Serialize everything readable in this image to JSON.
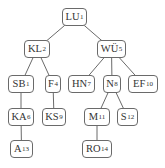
{
  "diagram": {
    "type": "tree",
    "colors": {
      "edge": "#6a6a6a",
      "border": "#6a6a6a",
      "text": "#333333",
      "background": "#ffffff"
    },
    "nodes": [
      {
        "id": "LU1",
        "label": "LU",
        "sub": "1",
        "x": 62,
        "y": 8,
        "w": 25
      },
      {
        "id": "KL2",
        "label": "KL",
        "sub": "2",
        "x": 24,
        "y": 40,
        "w": 26
      },
      {
        "id": "WU5",
        "label": "WÜ",
        "sub": "5",
        "x": 97,
        "y": 40,
        "w": 29
      },
      {
        "id": "SB1",
        "label": "SB",
        "sub": "1",
        "x": 8,
        "y": 75,
        "w": 26
      },
      {
        "id": "F4",
        "label": "F",
        "sub": "4",
        "x": 45,
        "y": 75,
        "w": 16
      },
      {
        "id": "HN7",
        "label": "HN",
        "sub": "7",
        "x": 68,
        "y": 75,
        "w": 27
      },
      {
        "id": "N8",
        "label": "N",
        "sub": "8",
        "x": 103,
        "y": 75,
        "w": 18
      },
      {
        "id": "EF10",
        "label": "EF",
        "sub": "10",
        "x": 128,
        "y": 75,
        "w": 30
      },
      {
        "id": "KA6",
        "label": "KA",
        "sub": "6",
        "x": 8,
        "y": 108,
        "w": 26
      },
      {
        "id": "KS9",
        "label": "KS",
        "sub": "9",
        "x": 42,
        "y": 108,
        "w": 24
      },
      {
        "id": "M11",
        "label": "M",
        "sub": "11",
        "x": 84,
        "y": 108,
        "w": 26
      },
      {
        "id": "S12",
        "label": "S",
        "sub": "12",
        "x": 117,
        "y": 108,
        "w": 21
      },
      {
        "id": "A13",
        "label": "A",
        "sub": "13",
        "x": 10,
        "y": 140,
        "w": 23
      },
      {
        "id": "RO14",
        "label": "RO",
        "sub": "14",
        "x": 82,
        "y": 140,
        "w": 30
      }
    ],
    "edges": [
      [
        "LU1",
        "KL2"
      ],
      [
        "LU1",
        "WU5"
      ],
      [
        "KL2",
        "SB1"
      ],
      [
        "KL2",
        "F4"
      ],
      [
        "WU5",
        "HN7"
      ],
      [
        "WU5",
        "N8"
      ],
      [
        "WU5",
        "EF10"
      ],
      [
        "SB1",
        "KA6"
      ],
      [
        "F4",
        "KS9"
      ],
      [
        "N8",
        "M11"
      ],
      [
        "N8",
        "S12"
      ],
      [
        "KA6",
        "A13"
      ],
      [
        "M11",
        "RO14"
      ]
    ]
  }
}
